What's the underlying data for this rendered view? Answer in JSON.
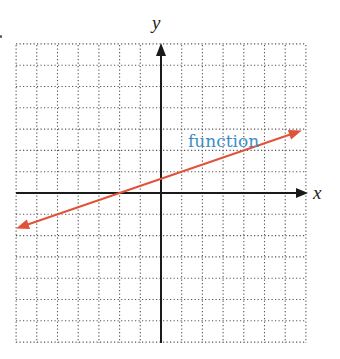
{
  "chart_data": {
    "type": "line",
    "title": "",
    "xlabel": "x",
    "ylabel": "y",
    "xlim": [
      -7,
      7
    ],
    "ylim": [
      -7,
      7
    ],
    "grid": true,
    "grid_style": "dotted",
    "legend": null,
    "annotations": [
      {
        "text": "function",
        "x": 1.2,
        "y": 2.1,
        "color": "#3b8fc4"
      }
    ],
    "series": [
      {
        "name": "function",
        "color": "#e0533a",
        "arrows": "both",
        "equation": "y = x/3 + 2/3",
        "x": [
          -7,
          -2,
          0,
          1,
          4,
          7
        ],
        "y": [
          -1.67,
          0,
          0.67,
          1,
          2,
          3
        ]
      }
    ]
  },
  "labels": {
    "x_axis": "x",
    "y_axis": "y",
    "function": "function"
  },
  "colors": {
    "axis": "#1a1a1a",
    "grid": "#555555",
    "line": "#e0533a",
    "label": "#3b8fc4"
  },
  "geometry": {
    "left": 16,
    "right": 306,
    "top": 45,
    "bottom": 343,
    "origin_x": 161,
    "origin_y": 193,
    "unit_x": 20.7,
    "unit_y": 21.3
  }
}
